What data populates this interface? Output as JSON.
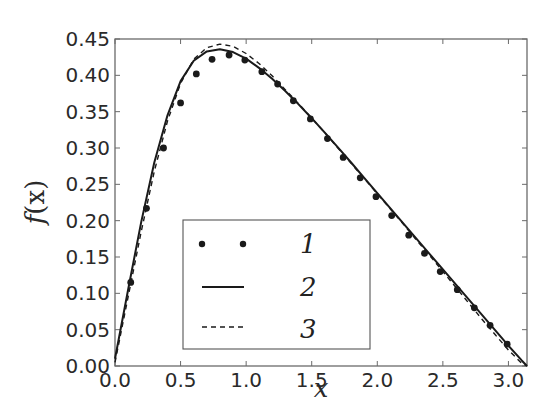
{
  "chart_data": {
    "type": "line",
    "title": "",
    "xlabel": "x",
    "ylabel": "f(x)",
    "xlim": [
      0,
      3.14159
    ],
    "ylim": [
      0,
      0.45
    ],
    "grid": false,
    "legend_position": "lower left (inside, x≈0.5–1.9, y≈0.0–0.14)",
    "x_ticks": [
      "0.0",
      "0.5",
      "1.0",
      "1.5",
      "2.0",
      "2.5",
      "3.0"
    ],
    "x_tick_values": [
      0,
      0.5,
      1.0,
      1.5,
      2.0,
      2.5,
      3.0
    ],
    "y_ticks": [
      "0.00",
      "0.05",
      "0.10",
      "0.15",
      "0.20",
      "0.25",
      "0.30",
      "0.35",
      "0.40",
      "0.45"
    ],
    "y_tick_values": [
      0,
      0.05,
      0.1,
      0.15,
      0.2,
      0.25,
      0.3,
      0.35,
      0.4,
      0.45
    ],
    "series": [
      {
        "name": "1",
        "style": "markers",
        "x": [
          0.12,
          0.24,
          0.37,
          0.5,
          0.62,
          0.74,
          0.87,
          0.99,
          1.12,
          1.24,
          1.36,
          1.49,
          1.62,
          1.74,
          1.87,
          1.99,
          2.11,
          2.24,
          2.36,
          2.48,
          2.61,
          2.74,
          2.86,
          2.99
        ],
        "y": [
          0.115,
          0.217,
          0.3,
          0.362,
          0.402,
          0.422,
          0.428,
          0.421,
          0.405,
          0.388,
          0.365,
          0.34,
          0.313,
          0.287,
          0.259,
          0.233,
          0.207,
          0.18,
          0.155,
          0.13,
          0.105,
          0.08,
          0.056,
          0.03
        ]
      },
      {
        "name": "2",
        "style": "solid",
        "x": [
          0.0,
          0.1,
          0.2,
          0.3,
          0.4,
          0.5,
          0.6,
          0.7,
          0.8,
          0.9,
          1.0,
          1.1,
          1.2,
          1.3,
          1.4,
          1.5,
          1.6,
          1.7,
          1.8,
          1.9,
          2.0,
          2.1,
          2.2,
          2.3,
          2.4,
          2.5,
          2.6,
          2.7,
          2.8,
          2.9,
          3.0,
          3.1,
          3.1416
        ],
        "y": [
          0.01,
          0.105,
          0.198,
          0.28,
          0.345,
          0.392,
          0.42,
          0.433,
          0.436,
          0.432,
          0.423,
          0.41,
          0.395,
          0.378,
          0.36,
          0.341,
          0.321,
          0.301,
          0.28,
          0.259,
          0.238,
          0.217,
          0.196,
          0.175,
          0.154,
          0.133,
          0.112,
          0.091,
          0.07,
          0.049,
          0.028,
          0.008,
          0.0
        ]
      },
      {
        "name": "3",
        "style": "dashed",
        "x": [
          0.0,
          0.1,
          0.2,
          0.3,
          0.4,
          0.5,
          0.6,
          0.7,
          0.8,
          0.9,
          1.0,
          1.1,
          1.2,
          1.3,
          1.4,
          1.5,
          1.6,
          1.7,
          1.8,
          1.9,
          2.0,
          2.1,
          2.2,
          2.3,
          2.4,
          2.5,
          2.6,
          2.7,
          2.8,
          2.9,
          3.0,
          3.1,
          3.1416
        ],
        "y": [
          0.005,
          0.095,
          0.185,
          0.268,
          0.337,
          0.389,
          0.422,
          0.438,
          0.443,
          0.44,
          0.43,
          0.416,
          0.399,
          0.38,
          0.361,
          0.341,
          0.321,
          0.3,
          0.279,
          0.258,
          0.237,
          0.216,
          0.195,
          0.173,
          0.152,
          0.13,
          0.108,
          0.086,
          0.064,
          0.043,
          0.022,
          0.004,
          0.0
        ]
      }
    ]
  },
  "legend": {
    "items": [
      {
        "label": "1",
        "style": "markers"
      },
      {
        "label": "2",
        "style": "solid"
      },
      {
        "label": "3",
        "style": "dashed"
      }
    ]
  },
  "axes": {
    "xlabel": "x",
    "ylabel_f": "f",
    "ylabel_arg": "(x)"
  }
}
